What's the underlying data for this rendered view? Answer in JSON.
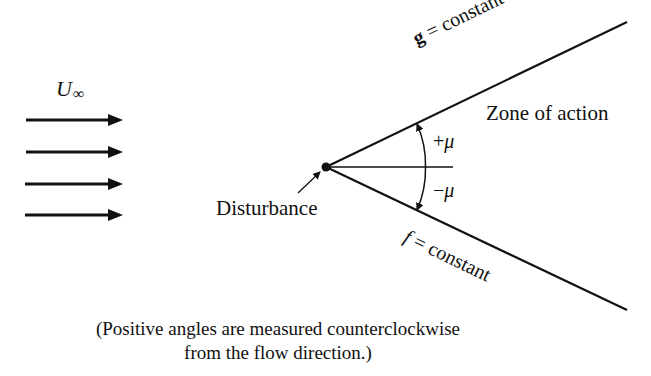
{
  "diagram": {
    "freestream": {
      "label": "U",
      "subscript": "∞",
      "arrow_count": 4
    },
    "disturbance_label": "Disturbance",
    "zone_label": "Zone of action",
    "upper_line": {
      "var": "g",
      "rest": " = constant"
    },
    "lower_line": {
      "var": "f",
      "rest": " = constant"
    },
    "angle_upper": {
      "sign": "+",
      "symbol": "μ"
    },
    "angle_lower": {
      "sign": "−",
      "symbol": "μ"
    },
    "caption": {
      "line1": "(Positive angles are measured counterclockwise",
      "line2": "from the flow direction.)"
    }
  }
}
